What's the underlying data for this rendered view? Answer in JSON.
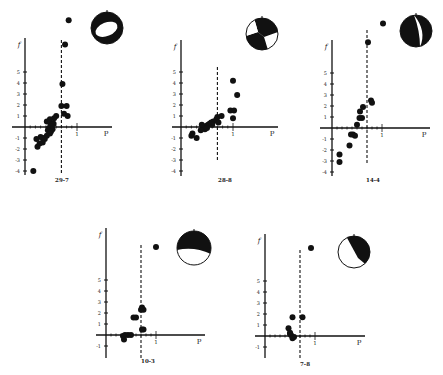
{
  "figure": {
    "background": "#ffffff",
    "ink": "#111111",
    "panels": [
      {
        "id": "29-7",
        "label": "29-7",
        "origin_px": [
          25,
          127
        ],
        "unit_x_px": 52,
        "unit_y_px": 11,
        "y_axis_top_px": 38,
        "y_axis_bottom_px": 175,
        "x_axis_left_px": 12,
        "x_axis_right_px": 112,
        "dashed_x": 0.7,
        "dashed_top_px": 40,
        "dashed_bottom_px": 175,
        "y_ticks": [
          5,
          4,
          3,
          2,
          1,
          -1,
          -2,
          -3,
          -4
        ],
        "x_tick_label": "1",
        "x_axis_label": "P",
        "y_axis_label": "f",
        "label_px": [
          62,
          182
        ],
        "beachball": {
          "cx": 107,
          "cy": 28,
          "r": 16,
          "type": "ring",
          "description": "black ring with white elliptical center"
        },
        "points": [
          [
            0.84,
            9.7
          ],
          [
            0.77,
            7.5
          ],
          [
            0.72,
            3.9
          ],
          [
            0.8,
            1.9
          ],
          [
            0.7,
            1.9
          ],
          [
            0.75,
            1.2
          ],
          [
            0.82,
            1.0
          ],
          [
            0.6,
            1.0
          ],
          [
            0.56,
            0.8
          ],
          [
            0.48,
            0.7
          ],
          [
            0.42,
            0.5
          ],
          [
            0.48,
            0.4
          ],
          [
            0.55,
            0.3
          ],
          [
            0.52,
            0.2
          ],
          [
            0.5,
            0.1
          ],
          [
            0.46,
            -0.1
          ],
          [
            0.53,
            -0.2
          ],
          [
            0.44,
            -0.3
          ],
          [
            0.5,
            -0.4
          ],
          [
            0.48,
            -0.6
          ],
          [
            0.42,
            -0.8
          ],
          [
            0.35,
            -1.0
          ],
          [
            0.3,
            -0.9
          ],
          [
            0.38,
            -1.1
          ],
          [
            0.22,
            -1.1
          ],
          [
            0.28,
            -1.5
          ],
          [
            0.24,
            -1.8
          ],
          [
            0.34,
            -1.4
          ],
          [
            0.16,
            -4.0
          ]
        ]
      },
      {
        "id": "28-8",
        "label": "28-8",
        "origin_px": [
          181,
          127
        ],
        "unit_x_px": 52,
        "unit_y_px": 11,
        "y_axis_top_px": 40,
        "y_axis_bottom_px": 176,
        "x_axis_left_px": 172,
        "x_axis_right_px": 278,
        "dashed_x": 0.7,
        "dashed_top_px": 67,
        "dashed_bottom_px": 162,
        "y_ticks": [
          5,
          4,
          3,
          2,
          1,
          -1,
          -2,
          -3,
          -4
        ],
        "x_tick_label": "1",
        "x_axis_label": "P",
        "y_axis_label": "f",
        "label_px": [
          225,
          182
        ],
        "beachball": {
          "cx": 262,
          "cy": 34,
          "r": 16,
          "type": "quadrant",
          "description": "strike-slip pattern, black top and lower-center"
        },
        "points": [
          [
            1.0,
            4.2
          ],
          [
            1.08,
            2.9
          ],
          [
            0.95,
            1.5
          ],
          [
            1.02,
            1.5
          ],
          [
            1.0,
            0.8
          ],
          [
            0.78,
            1.0
          ],
          [
            0.7,
            0.9
          ],
          [
            0.68,
            0.7
          ],
          [
            0.62,
            0.5
          ],
          [
            0.58,
            0.4
          ],
          [
            0.55,
            0.3
          ],
          [
            0.6,
            0.2
          ],
          [
            0.52,
            0.2
          ],
          [
            0.48,
            0.1
          ],
          [
            0.45,
            0.0
          ],
          [
            0.42,
            -0.1
          ],
          [
            0.46,
            -0.2
          ],
          [
            0.38,
            -0.3
          ],
          [
            0.4,
            0.2
          ],
          [
            0.5,
            -0.1
          ],
          [
            0.72,
            0.4
          ],
          [
            0.22,
            -0.6
          ],
          [
            0.2,
            -0.8
          ],
          [
            0.3,
            -1.0
          ]
        ]
      },
      {
        "id": "14-4",
        "label": "14-4",
        "origin_px": [
          332,
          128
        ],
        "unit_x_px": 50,
        "unit_y_px": 11,
        "y_axis_top_px": 40,
        "y_axis_bottom_px": 176,
        "x_axis_left_px": 320,
        "x_axis_right_px": 430,
        "dashed_x": 0.7,
        "dashed_top_px": 30,
        "dashed_bottom_px": 163,
        "y_ticks": [
          5,
          4,
          3,
          2,
          1,
          -1,
          -2,
          -3,
          -4
        ],
        "x_tick_label": "1",
        "x_axis_label": "P",
        "y_axis_label": "f",
        "label_px": [
          373,
          182
        ],
        "beachball": {
          "cx": 416,
          "cy": 31,
          "r": 16,
          "type": "crescent",
          "description": "mostly black with white crescent on right"
        },
        "points": [
          [
            1.02,
            9.5
          ],
          [
            0.72,
            7.8
          ],
          [
            0.78,
            2.5
          ],
          [
            0.8,
            2.3
          ],
          [
            0.62,
            1.9
          ],
          [
            0.56,
            1.5
          ],
          [
            0.6,
            0.9
          ],
          [
            0.55,
            0.9
          ],
          [
            0.5,
            0.3
          ],
          [
            0.42,
            -0.6
          ],
          [
            0.38,
            -0.6
          ],
          [
            0.46,
            -0.7
          ],
          [
            0.35,
            -1.6
          ],
          [
            0.15,
            -2.4
          ],
          [
            0.15,
            -3.1
          ]
        ]
      },
      {
        "id": "10-3",
        "label": "10-3",
        "origin_px": [
          106,
          335
        ],
        "unit_x_px": 50,
        "unit_y_px": 11,
        "y_axis_top_px": 228,
        "y_axis_bottom_px": 358,
        "x_axis_left_px": 96,
        "x_axis_right_px": 205,
        "dashed_x": 0.7,
        "dashed_top_px": 245,
        "dashed_bottom_px": 358,
        "y_ticks": [
          5,
          4,
          3,
          2,
          1,
          -1
        ],
        "x_tick_label": "1",
        "x_axis_label": "P",
        "y_axis_label": "f",
        "label_px": [
          148,
          363
        ],
        "beachball": {
          "cx": 194,
          "cy": 248,
          "r": 17,
          "type": "upper-black",
          "description": "black upper region with white lower part"
        },
        "points": [
          [
            1.0,
            8.0
          ],
          [
            0.72,
            2.5
          ],
          [
            0.75,
            2.3
          ],
          [
            0.7,
            2.3
          ],
          [
            0.6,
            1.6
          ],
          [
            0.55,
            1.6
          ],
          [
            0.75,
            0.5
          ],
          [
            0.72,
            0.5
          ],
          [
            0.5,
            0.0
          ],
          [
            0.44,
            0.0
          ],
          [
            0.38,
            0.0
          ],
          [
            0.34,
            -0.1
          ],
          [
            0.36,
            -0.4
          ]
        ]
      },
      {
        "id": "7-8",
        "label": "7-8",
        "origin_px": [
          265,
          336
        ],
        "unit_x_px": 50,
        "unit_y_px": 11,
        "y_axis_top_px": 234,
        "y_axis_bottom_px": 358,
        "x_axis_left_px": 255,
        "x_axis_right_px": 365,
        "dashed_x": 0.7,
        "dashed_top_px": 250,
        "dashed_bottom_px": 360,
        "y_ticks": [
          5,
          4,
          3,
          2,
          1,
          -1
        ],
        "x_tick_label": "1",
        "x_axis_label": "P",
        "y_axis_label": "f",
        "label_px": [
          305,
          366
        ],
        "beachball": {
          "cx": 354,
          "cy": 252,
          "r": 16,
          "type": "diagonal",
          "description": "black upper-right, white lower-left split diagonally"
        },
        "points": [
          [
            0.92,
            8.0
          ],
          [
            0.55,
            1.7
          ],
          [
            0.75,
            1.7
          ],
          [
            0.47,
            0.7
          ],
          [
            0.5,
            0.2
          ],
          [
            0.52,
            0.1
          ],
          [
            0.55,
            -0.2
          ],
          [
            0.58,
            -0.1
          ],
          [
            0.5,
            0.3
          ]
        ]
      }
    ]
  },
  "chart_data": [
    {
      "type": "scatter",
      "title": "29-7",
      "xlabel": "P",
      "ylabel": "f",
      "y_ticks": [
        5,
        4,
        3,
        2,
        1,
        -1,
        -2,
        -3,
        -4
      ],
      "x_ticks": [
        1
      ],
      "reference_line_x": 0.7,
      "grid": false
    },
    {
      "type": "scatter",
      "title": "28-8",
      "xlabel": "P",
      "ylabel": "f",
      "y_ticks": [
        5,
        4,
        3,
        2,
        1,
        -1,
        -2,
        -3,
        -4
      ],
      "x_ticks": [
        1
      ],
      "reference_line_x": 0.7,
      "grid": false
    },
    {
      "type": "scatter",
      "title": "14-4",
      "xlabel": "P",
      "ylabel": "f",
      "y_ticks": [
        5,
        4,
        3,
        2,
        1,
        -1,
        -2,
        -3,
        -4
      ],
      "x_ticks": [
        1
      ],
      "reference_line_x": 0.7,
      "grid": false
    },
    {
      "type": "scatter",
      "title": "10-3",
      "xlabel": "P",
      "ylabel": "f",
      "y_ticks": [
        5,
        4,
        3,
        2,
        1,
        -1
      ],
      "x_ticks": [
        1
      ],
      "reference_line_x": 0.7,
      "grid": false
    },
    {
      "type": "scatter",
      "title": "7-8",
      "xlabel": "P",
      "ylabel": "f",
      "y_ticks": [
        5,
        4,
        3,
        2,
        1,
        -1
      ],
      "x_ticks": [
        1
      ],
      "reference_line_x": 0.7,
      "grid": false
    }
  ]
}
